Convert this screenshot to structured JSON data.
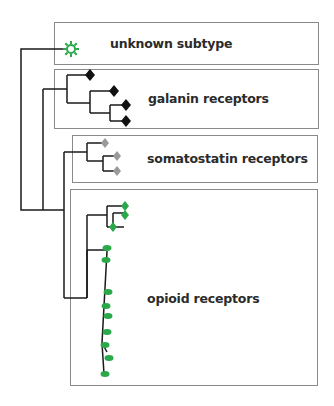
{
  "diagram": {
    "type": "phylogenetic-tree",
    "colors": {
      "unknown": "#2aa84a",
      "galanin": "#111111",
      "somatostatin": "#9a9a9a",
      "opioid": "#2aa84a",
      "branch": "#1a1a1a",
      "box_border": "#8a8a8a"
    },
    "groups": [
      {
        "id": "unknown",
        "label": "unknown subtype",
        "marker": "star-icon",
        "leaf_count": 1
      },
      {
        "id": "galanin",
        "label": "galanin receptors",
        "marker": "diamond-icon",
        "leaf_count": 4
      },
      {
        "id": "somatostatin",
        "label": "somatostatin receptors",
        "marker": "diamond-icon",
        "leaf_count": 3
      },
      {
        "id": "opioid",
        "label": "opioid receptors",
        "marker": "diamond-and-oval-icons",
        "leaf_count": 12
      }
    ]
  }
}
